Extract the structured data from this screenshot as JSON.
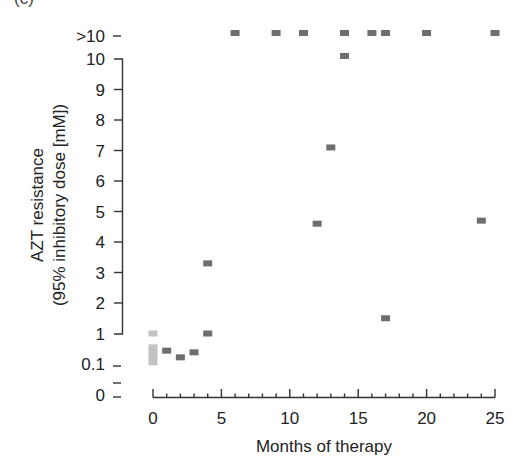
{
  "caption_partial": "(c)",
  "chart_data": {
    "type": "scatter",
    "title": "",
    "xlabel": "Months of therapy",
    "ylabel_line1": "AZT resistance",
    "ylabel_line2": "(95% inhibitory dose [mM])",
    "x_ticks": [
      0,
      5,
      10,
      15,
      20,
      25
    ],
    "x_minor_step": 1,
    "xlim": [
      0,
      25
    ],
    "y_ticks": [
      {
        "label": "0",
        "value": 0
      },
      {
        "label": "",
        "value": 0.05
      },
      {
        "label": "0.1",
        "value": 0.1
      },
      {
        "label": "1",
        "value": 1
      },
      {
        "label": "2",
        "value": 2
      },
      {
        "label": "3",
        "value": 3
      },
      {
        "label": "4",
        "value": 4
      },
      {
        "label": "5",
        "value": 5
      },
      {
        "label": "6",
        "value": 6
      },
      {
        "label": "7",
        "value": 7
      },
      {
        "label": "8",
        "value": 8
      },
      {
        "label": "9",
        "value": 9
      },
      {
        "label": "10",
        "value": 10
      },
      {
        "label": ">10",
        "value": 11
      }
    ],
    "y_scale_note": "broken axis: 0 and 0.1 compressed below 1; 1-10 linear; >10 category above",
    "grid": false,
    "legend": null,
    "series": [
      {
        "name": "early isolates (light)",
        "color": "#c2c2c2",
        "points": [
          {
            "x": 0,
            "y": 1.0
          },
          {
            "x": 0,
            "y": 0.6
          },
          {
            "x": 0,
            "y": 0.45
          },
          {
            "x": 0,
            "y": 0.3
          },
          {
            "x": 0,
            "y": 0.15
          }
        ]
      },
      {
        "name": "isolates (dark)",
        "color": "#6e6e6e",
        "points": [
          {
            "x": 1,
            "y": 0.5
          },
          {
            "x": 2,
            "y": 0.3
          },
          {
            "x": 3,
            "y": 0.45
          },
          {
            "x": 4,
            "y": 1.0
          },
          {
            "x": 4,
            "y": 3.3
          },
          {
            "x": 6,
            "y": ">10"
          },
          {
            "x": 9,
            "y": ">10"
          },
          {
            "x": 11,
            "y": ">10"
          },
          {
            "x": 12,
            "y": 4.6
          },
          {
            "x": 13,
            "y": 7.1
          },
          {
            "x": 14,
            "y": 10.1
          },
          {
            "x": 14,
            "y": ">10"
          },
          {
            "x": 16,
            "y": ">10"
          },
          {
            "x": 17,
            "y": ">10"
          },
          {
            "x": 17,
            "y": 1.5
          },
          {
            "x": 20,
            "y": ">10"
          },
          {
            "x": 24,
            "y": 4.7
          },
          {
            "x": 25,
            "y": ">10"
          }
        ]
      }
    ]
  }
}
